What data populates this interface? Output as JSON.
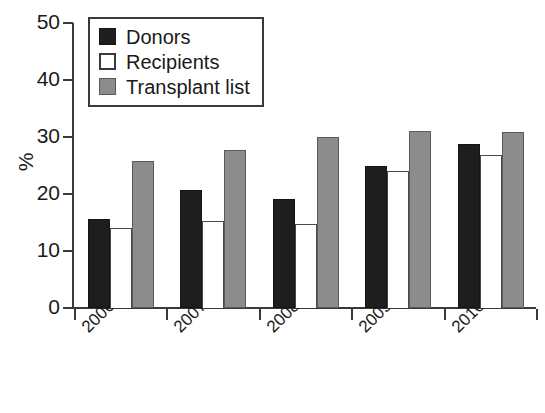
{
  "chart_data": {
    "type": "bar",
    "title": "",
    "xlabel": "",
    "ylabel": "%",
    "ylim": [
      0,
      50
    ],
    "yticks": [
      0,
      10,
      20,
      30,
      40,
      50
    ],
    "grid": false,
    "legend_position": "top-left",
    "categories": [
      "2006-2007",
      "2007-2008",
      "2008-2009",
      "2009-2010",
      "2010-2011"
    ],
    "series": [
      {
        "name": "Donors",
        "color": "#1e1e1e",
        "values": [
          15.7,
          20.7,
          19.1,
          25.0,
          28.8
        ]
      },
      {
        "name": "Recipients",
        "color": "#ffffff",
        "values": [
          14.0,
          15.3,
          14.8,
          24.0,
          26.8
        ]
      },
      {
        "name": "Transplant list",
        "color": "#8c8c8c",
        "values": [
          25.8,
          27.7,
          30.0,
          31.1,
          30.9
        ]
      }
    ]
  },
  "legend": {
    "items": [
      {
        "label": "Donors",
        "swatch": "donors"
      },
      {
        "label": "Recipients",
        "swatch": "recipients"
      },
      {
        "label": "Transplant list",
        "swatch": "transplant"
      }
    ]
  }
}
